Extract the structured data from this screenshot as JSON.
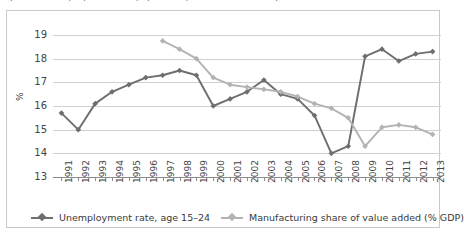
{
  "figure": {
    "clipped_title": "Figure 3. Unemployment rate (age 15–24) and manufacturing share of value added",
    "axis_y_title": "%",
    "border_color": "#c9c9c9",
    "grid_color": "#d0d0d0"
  },
  "legend": {
    "position": "bottom",
    "items": [
      {
        "label": "Unemployment rate, age 15–24",
        "color": "#6e6e6e"
      },
      {
        "label": "Manufacturing share of value added (% GDP)",
        "color": "#b3b3b3"
      }
    ]
  },
  "chart_data": {
    "type": "line",
    "title": "",
    "xlabel": "",
    "ylabel": "%",
    "ylim": [
      13,
      19
    ],
    "yticks": [
      13,
      14,
      15,
      16,
      17,
      18,
      19
    ],
    "grid": true,
    "legend_position": "bottom",
    "categories": [
      "1991",
      "1992",
      "1993",
      "1994",
      "1995",
      "1996",
      "1997",
      "1998",
      "1999",
      "2000",
      "2001",
      "2002",
      "2003",
      "2004",
      "2005",
      "2006",
      "2007",
      "2008",
      "2009",
      "2010",
      "2011",
      "2012",
      "2013"
    ],
    "series": [
      {
        "name": "Unemployment rate, age 15–24",
        "color": "#6e6e6e",
        "values": [
          15.7,
          15.0,
          16.1,
          16.6,
          16.9,
          17.2,
          17.3,
          17.5,
          17.3,
          16.0,
          16.3,
          16.6,
          17.1,
          16.5,
          16.3,
          15.6,
          14.0,
          14.3,
          18.1,
          18.4,
          17.9,
          18.2,
          18.3
        ]
      },
      {
        "name": "Manufacturing share of value added (% GDP)",
        "color": "#b3b3b3",
        "values": [
          null,
          null,
          null,
          null,
          null,
          null,
          18.75,
          18.4,
          18.0,
          17.2,
          16.9,
          16.8,
          16.7,
          16.6,
          16.4,
          16.1,
          15.9,
          15.5,
          14.3,
          15.1,
          15.2,
          15.1,
          14.8
        ]
      }
    ]
  }
}
